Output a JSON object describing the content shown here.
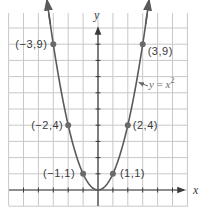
{
  "chart_data": {
    "type": "line",
    "title": "",
    "xlabel": "x",
    "ylabel": "y",
    "function": "y = x^2",
    "xlim": [
      -6,
      6
    ],
    "ylim": [
      -1,
      11
    ],
    "grid": true,
    "legend": null,
    "series": [
      {
        "name": "y = x²",
        "x": [
          -3,
          -2,
          -1,
          0,
          1,
          2,
          3
        ],
        "y": [
          9,
          4,
          1,
          0,
          1,
          4,
          9
        ]
      }
    ],
    "points": [
      {
        "x": -3,
        "y": 9,
        "label": "(−3,9)"
      },
      {
        "x": -2,
        "y": 4,
        "label": "(−2,4)"
      },
      {
        "x": -1,
        "y": 1,
        "label": "(−1,1)"
      },
      {
        "x": 1,
        "y": 1,
        "label": "(1,1)"
      },
      {
        "x": 2,
        "y": 4,
        "label": "(2,4)"
      },
      {
        "x": 3,
        "y": 9,
        "label": "(3,9)"
      }
    ],
    "annotations": [
      {
        "text": "y = x²",
        "points_to": {
          "x": 2.6,
          "y": 6.7
        }
      }
    ]
  },
  "labels": {
    "x_axis": "x",
    "y_axis": "y",
    "equation_y": "y",
    "equation_eq": " = ",
    "equation_x": "x",
    "equation_exp": "2"
  },
  "colors": {
    "grid": "#c8c8c8",
    "axis": "#3a3a3a",
    "curve": "#5a5a5a",
    "point": "#6a6a6a"
  }
}
